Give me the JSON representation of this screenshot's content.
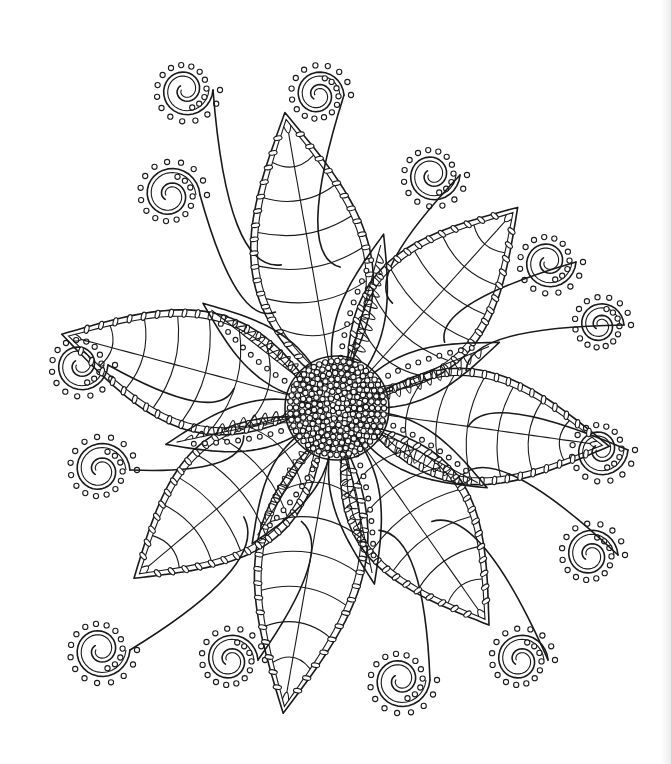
{
  "artwork": {
    "subject": "Zentangle-style flower coloring page",
    "colors": {
      "background": "#ffffff",
      "ink": "#1a1a1a",
      "edge_shadow": "#ececec"
    },
    "center": {
      "x": 337,
      "y": 408,
      "radius": 52
    },
    "outer_petals": [
      {
        "angle": -100,
        "length": 280,
        "width": 120
      },
      {
        "angle": -48,
        "length": 250,
        "width": 120
      },
      {
        "angle": 8,
        "length": 255,
        "width": 115
      },
      {
        "angle": 55,
        "length": 245,
        "width": 120
      },
      {
        "angle": 100,
        "length": 290,
        "width": 110
      },
      {
        "angle": 140,
        "length": 245,
        "width": 120
      },
      {
        "angle": 195,
        "length": 265,
        "width": 120
      }
    ],
    "inner_petals": [
      {
        "angle": -75,
        "length": 170,
        "width": 48
      },
      {
        "angle": -22,
        "length": 165,
        "width": 48
      },
      {
        "angle": 28,
        "length": 160,
        "width": 48
      },
      {
        "angle": 78,
        "length": 170,
        "width": 48
      },
      {
        "angle": 122,
        "length": 150,
        "width": 48
      },
      {
        "angle": 168,
        "length": 165,
        "width": 48
      },
      {
        "angle": 218,
        "length": 160,
        "width": 48
      }
    ],
    "spirals": [
      {
        "cx": 185,
        "cy": 90,
        "r": 28,
        "dir": 1
      },
      {
        "cx": 170,
        "cy": 195,
        "r": 30,
        "dir": -1
      },
      {
        "cx": 318,
        "cy": 95,
        "r": 26,
        "dir": -1
      },
      {
        "cx": 432,
        "cy": 175,
        "r": 28,
        "dir": 1
      },
      {
        "cx": 548,
        "cy": 262,
        "r": 28,
        "dir": 1
      },
      {
        "cx": 600,
        "cy": 325,
        "r": 24,
        "dir": -1
      },
      {
        "cx": 80,
        "cy": 365,
        "r": 28,
        "dir": 1
      },
      {
        "cx": 100,
        "cy": 470,
        "r": 30,
        "dir": -1
      },
      {
        "cx": 600,
        "cy": 450,
        "r": 28,
        "dir": 1
      },
      {
        "cx": 590,
        "cy": 555,
        "r": 28,
        "dir": -1
      },
      {
        "cx": 100,
        "cy": 650,
        "r": 30,
        "dir": 1
      },
      {
        "cx": 230,
        "cy": 660,
        "r": 28,
        "dir": -1
      },
      {
        "cx": 400,
        "cy": 680,
        "r": 30,
        "dir": 1
      },
      {
        "cx": 520,
        "cy": 660,
        "r": 28,
        "dir": -1
      }
    ]
  }
}
